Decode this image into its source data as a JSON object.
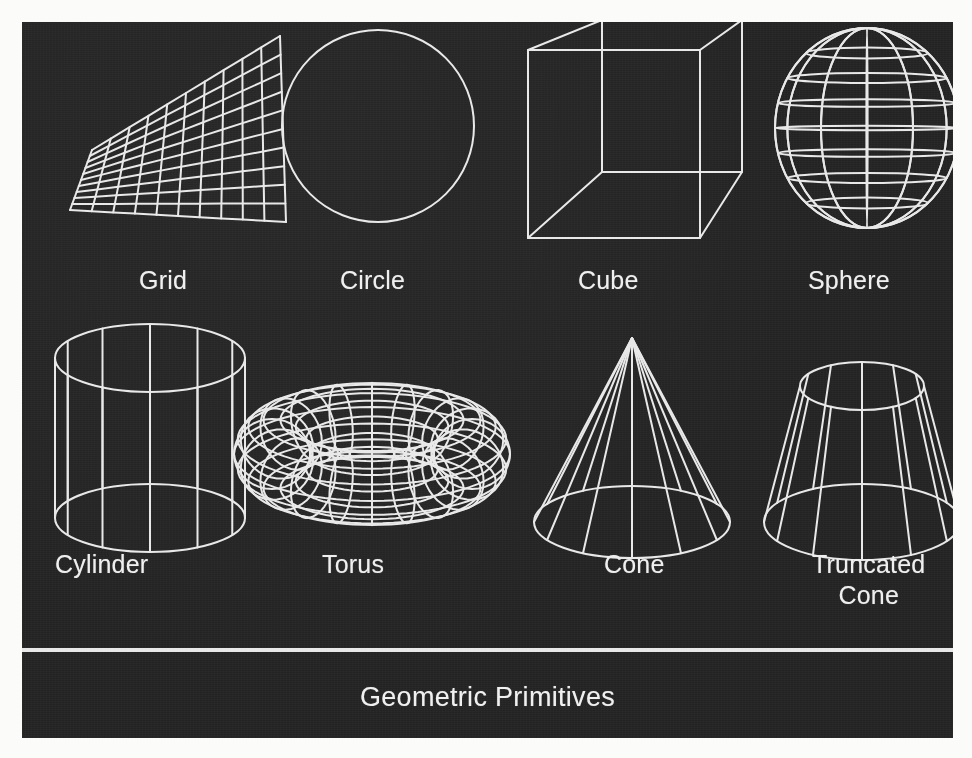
{
  "panel": {
    "background_color": "#232323",
    "stroke_color": "#e8e8e8"
  },
  "caption": {
    "text": "Geometric Primitives",
    "rule": true
  },
  "figures": [
    {
      "id": "grid",
      "label": "Grid",
      "label_x": 117,
      "label_y": 243,
      "kind": "grid",
      "divisions": 10,
      "corners": [
        [
          70,
          170
        ],
        [
          165,
          100
        ],
        [
          245,
          16
        ],
        [
          250,
          200
        ]
      ]
    },
    {
      "id": "circle",
      "label": "Circle",
      "label_x": 318,
      "label_y": 243,
      "kind": "circle",
      "cx": 356,
      "cy": 104,
      "r": 96
    },
    {
      "id": "cube",
      "label": "Cube",
      "label_x": 556,
      "label_y": 243,
      "kind": "cube",
      "cx": 610,
      "cy": 108
    },
    {
      "id": "sphere",
      "label": "Sphere",
      "label_x": 786,
      "label_y": 243,
      "kind": "sphere",
      "cx": 845,
      "cy": 106,
      "rx": 92,
      "ry": 100,
      "meridians": 12,
      "parallels": 7
    },
    {
      "id": "cylinder",
      "label": "Cylinder",
      "label_x": 33,
      "label_y": 527,
      "kind": "cylinder",
      "cx": 128,
      "top_y": 336,
      "bottom_y": 496,
      "rx": 95,
      "ry": 34,
      "segments": 12
    },
    {
      "id": "torus",
      "label": "Torus",
      "label_x": 300,
      "label_y": 527,
      "kind": "torus",
      "cx": 350,
      "cy": 432,
      "major_r": 100,
      "minor_r": 38,
      "tube_segments": 20,
      "ring_segments": 14
    },
    {
      "id": "cone",
      "label": "Cone",
      "label_x": 582,
      "label_y": 527,
      "kind": "cone",
      "apex_x": 610,
      "apex_y": 316,
      "base_y": 500,
      "rx": 98,
      "ry": 36,
      "segments": 12
    },
    {
      "id": "truncated-cone",
      "label": "Truncated\nCone",
      "label_x": 790,
      "label_y": 527,
      "label_two_line": true,
      "kind": "truncated-cone",
      "cx": 840,
      "top_y": 364,
      "bottom_y": 500,
      "top_rx": 62,
      "top_ry": 24,
      "bottom_rx": 98,
      "bottom_ry": 38,
      "segments": 12
    }
  ]
}
